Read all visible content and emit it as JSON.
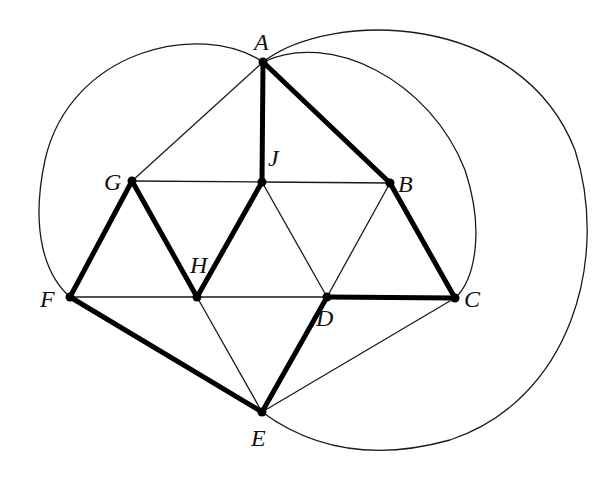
{
  "diagram": {
    "type": "graph",
    "colors": {
      "line": "#1a1a1a",
      "bold": "#000000",
      "background": "#ffffff"
    },
    "vertices": [
      {
        "id": "A",
        "label": "A",
        "x": 263,
        "y": 62,
        "lx": 254,
        "ly": 50
      },
      {
        "id": "B",
        "label": "B",
        "x": 390,
        "y": 183,
        "lx": 398,
        "ly": 192
      },
      {
        "id": "C",
        "label": "C",
        "x": 455,
        "y": 298,
        "lx": 464,
        "ly": 307
      },
      {
        "id": "D",
        "label": "D",
        "x": 327,
        "y": 297,
        "lx": 316,
        "ly": 326
      },
      {
        "id": "E",
        "label": "E",
        "x": 262,
        "y": 412,
        "lx": 251,
        "ly": 446
      },
      {
        "id": "F",
        "label": "F",
        "x": 70,
        "y": 297,
        "lx": 40,
        "ly": 307
      },
      {
        "id": "G",
        "label": "G",
        "x": 132,
        "y": 181,
        "lx": 104,
        "ly": 190
      },
      {
        "id": "H",
        "label": "H",
        "x": 197,
        "y": 297,
        "lx": 190,
        "ly": 273
      },
      {
        "id": "J",
        "label": "J",
        "x": 262,
        "y": 182,
        "lx": 268,
        "ly": 166
      }
    ],
    "edges_straight": [
      {
        "from": "A",
        "to": "J",
        "bold": true
      },
      {
        "from": "A",
        "to": "B",
        "bold": true
      },
      {
        "from": "A",
        "to": "G",
        "bold": false
      },
      {
        "from": "G",
        "to": "J",
        "bold": false
      },
      {
        "from": "J",
        "to": "B",
        "bold": false
      },
      {
        "from": "G",
        "to": "F",
        "bold": true
      },
      {
        "from": "G",
        "to": "H",
        "bold": true
      },
      {
        "from": "J",
        "to": "H",
        "bold": true
      },
      {
        "from": "J",
        "to": "D",
        "bold": false
      },
      {
        "from": "B",
        "to": "D",
        "bold": false
      },
      {
        "from": "B",
        "to": "C",
        "bold": true
      },
      {
        "from": "F",
        "to": "H",
        "bold": false
      },
      {
        "from": "H",
        "to": "D",
        "bold": false
      },
      {
        "from": "D",
        "to": "C",
        "bold": true
      },
      {
        "from": "F",
        "to": "E",
        "bold": true
      },
      {
        "from": "H",
        "to": "E",
        "bold": false
      },
      {
        "from": "D",
        "to": "E",
        "bold": true
      },
      {
        "from": "C",
        "to": "E",
        "bold": false
      }
    ],
    "edges_curved": [
      {
        "from": "A",
        "to": "F",
        "bold": false,
        "path": "M263,62 C200,20 70,50 45,160 C30,230 45,275 70,297"
      },
      {
        "from": "A",
        "to": "C",
        "bold": false,
        "path": "M263,62 C330,30 430,80 465,170 C485,230 475,280 455,298"
      },
      {
        "from": "A",
        "to": "E",
        "bold": false,
        "path": "M263,62 C330,10 520,10 575,150 C610,260 570,400 450,440 C360,465 300,440 262,412"
      }
    ],
    "bold_cycle": [
      "A",
      "B",
      "C",
      "D",
      "E",
      "F",
      "G",
      "H",
      "J",
      "A"
    ]
  }
}
